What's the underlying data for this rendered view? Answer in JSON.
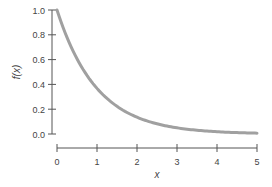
{
  "chart_data": {
    "type": "line",
    "title": "",
    "xlabel": "x",
    "ylabel": "f(x)",
    "xlim": [
      0,
      5
    ],
    "ylim": [
      0,
      1.0
    ],
    "grid": false,
    "legend": null,
    "x_ticks": [
      "0",
      "1",
      "2",
      "3",
      "4",
      "5"
    ],
    "y_ticks": [
      "0.0",
      "0.2",
      "0.4",
      "0.6",
      "0.8",
      "1.0"
    ],
    "series": [
      {
        "name": "f(x)",
        "function": "e^(-x)",
        "x": [
          0,
          0.5,
          1,
          1.5,
          2,
          2.5,
          3,
          3.5,
          4,
          4.5,
          5
        ],
        "values": [
          1.0,
          0.61,
          0.37,
          0.22,
          0.14,
          0.08,
          0.05,
          0.03,
          0.02,
          0.01,
          0.01
        ],
        "color": "#a0a0a0"
      }
    ]
  },
  "colors": {
    "axis": "#555555",
    "curve": "#a0a0a0"
  }
}
